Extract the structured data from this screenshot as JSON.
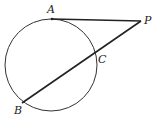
{
  "diagram": {
    "type": "geometry",
    "circle": {
      "cx": 51,
      "cy": 65,
      "r": 46
    },
    "points": {
      "A": {
        "label": "A",
        "x": 52,
        "y": 19,
        "lx": 47,
        "ly": 13
      },
      "P": {
        "label": "P",
        "x": 141,
        "y": 21,
        "lx": 144,
        "ly": 24
      },
      "C": {
        "label": "C",
        "x": 94,
        "y": 56,
        "lx": 98,
        "ly": 63
      },
      "B": {
        "label": "B",
        "x": 22,
        "y": 103,
        "lx": 14,
        "ly": 114
      }
    },
    "segments": [
      {
        "from": "A",
        "to": "P",
        "kind": "tangent"
      },
      {
        "from": "P",
        "to": "B",
        "kind": "secant"
      }
    ],
    "stroke_color": "#222222"
  }
}
